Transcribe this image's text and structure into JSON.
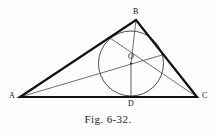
{
  "figure": {
    "caption": "Fig. 6-32.",
    "colors": {
      "background": "#fdfdfc",
      "triangle_stroke": "#111111",
      "circle_stroke": "#3a3a3a",
      "bisector_stroke": "#4a4a4a",
      "label_text": "#141414",
      "caption_text": "#1c1c1c"
    },
    "stroke_widths": {
      "triangle": 2.2,
      "circle": 0.9,
      "bisector": 0.8
    }
  },
  "labels": {
    "a": "A",
    "b": "B",
    "c": "C",
    "o": "O",
    "d": "D"
  },
  "geometry": {
    "points": {
      "A": {
        "x": 20,
        "y": 97
      },
      "B": {
        "x": 136,
        "y": 20
      },
      "C": {
        "x": 197,
        "y": 97
      },
      "O": {
        "x": 131,
        "y": 63.5
      },
      "D": {
        "x": 131,
        "y": 96.5
      }
    },
    "incircle": {
      "cx": 131,
      "cy": 63.5,
      "r": 32.5
    },
    "triangle_path": "M 20 97 L 136 20 L 197 97 Z",
    "segments": [
      {
        "name": "bisector-AO-extended",
        "x1": 20,
        "y1": 97,
        "x2": 162,
        "y2": 55
      },
      {
        "name": "bisector-CO-extended",
        "x1": 197,
        "y1": 97,
        "x2": 110,
        "y2": 38
      },
      {
        "name": "bisector-BO",
        "x1": 136,
        "y1": 20,
        "x2": 131,
        "y2": 63.5
      },
      {
        "name": "radius-OD",
        "x1": 131,
        "y1": 63.5,
        "x2": 131,
        "y2": 96.5
      },
      {
        "name": "chord-AO-to-O",
        "x1": 20,
        "y1": 97,
        "x2": 131,
        "y2": 63.5
      },
      {
        "name": "chord-CO-to-O",
        "x1": 197,
        "y1": 97,
        "x2": 131,
        "y2": 63.5
      }
    ]
  },
  "label_positions": {
    "a": {
      "left": 9,
      "top": 92
    },
    "b": {
      "left": 133,
      "top": 8
    },
    "c": {
      "left": 202,
      "top": 92
    },
    "o": {
      "left": 128,
      "top": 53
    },
    "d": {
      "left": 128,
      "top": 100
    }
  }
}
